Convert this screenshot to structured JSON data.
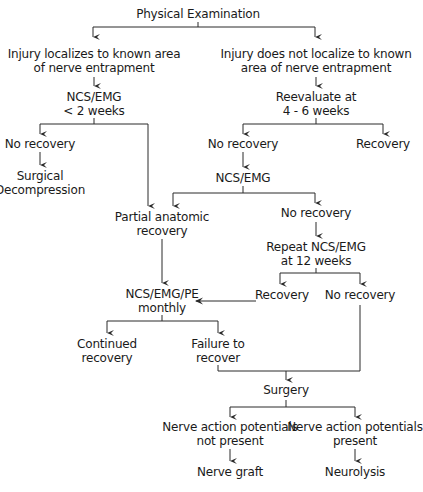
{
  "flowchart": {
    "nodes": [
      {
        "id": "physical-exam",
        "lines": [
          "Physical Examination"
        ],
        "x": 198,
        "y": 7
      },
      {
        "id": "injury-localizes",
        "lines": [
          "Injury localizes to known area",
          "of nerve entrapment"
        ],
        "x": 94,
        "y": 47
      },
      {
        "id": "injury-not-localize",
        "lines": [
          "Injury does not localize to known",
          "area of nerve entrapment"
        ],
        "x": 316,
        "y": 47
      },
      {
        "id": "ncs-emg-2wk",
        "lines": [
          "NCS/EMG",
          "< 2 weeks"
        ],
        "x": 94,
        "y": 90
      },
      {
        "id": "reevaluate",
        "lines": [
          "Reevaluate at",
          "4 - 6 weeks"
        ],
        "x": 316,
        "y": 90
      },
      {
        "id": "no-recovery-left",
        "lines": [
          "No recovery"
        ],
        "x": 40,
        "y": 137
      },
      {
        "id": "no-recovery-mid",
        "lines": [
          "No recovery"
        ],
        "x": 243,
        "y": 137
      },
      {
        "id": "recovery-right",
        "lines": [
          "Recovery"
        ],
        "x": 383,
        "y": 137
      },
      {
        "id": "surgical-decompression",
        "lines": [
          "Surgical",
          "Decompression"
        ],
        "x": 40,
        "y": 169
      },
      {
        "id": "ncs-emg-mid",
        "lines": [
          "NCS/EMG"
        ],
        "x": 243,
        "y": 171
      },
      {
        "id": "partial-anatomic",
        "lines": [
          "Partial anatomic",
          "recovery"
        ],
        "x": 162,
        "y": 210
      },
      {
        "id": "no-recovery-2",
        "lines": [
          "No recovery"
        ],
        "x": 316,
        "y": 206
      },
      {
        "id": "repeat-ncs",
        "lines": [
          "Repeat NCS/EMG",
          "at 12 weeks"
        ],
        "x": 316,
        "y": 240
      },
      {
        "id": "ncs-emg-pe",
        "lines": [
          "NCS/EMG/PE",
          "monthly"
        ],
        "x": 162,
        "y": 287
      },
      {
        "id": "recovery-12",
        "lines": [
          "Recovery"
        ],
        "x": 282,
        "y": 288
      },
      {
        "id": "no-recovery-12",
        "lines": [
          "No recovery"
        ],
        "x": 360,
        "y": 288
      },
      {
        "id": "continued-recovery",
        "lines": [
          "Continued",
          "recovery"
        ],
        "x": 107,
        "y": 337
      },
      {
        "id": "failure-to-recover",
        "lines": [
          "Failure to",
          "recover"
        ],
        "x": 218,
        "y": 337
      },
      {
        "id": "surgery",
        "lines": [
          "Surgery"
        ],
        "x": 286,
        "y": 383
      },
      {
        "id": "nap-not-present",
        "lines": [
          "Nerve action potentials",
          "not present"
        ],
        "x": 230,
        "y": 420
      },
      {
        "id": "nap-present",
        "lines": [
          "Nerve action potentials",
          "present"
        ],
        "x": 355,
        "y": 420
      },
      {
        "id": "nerve-graft",
        "lines": [
          "Nerve graft"
        ],
        "x": 230,
        "y": 465
      },
      {
        "id": "neurolysis",
        "lines": [
          "Neurolysis"
        ],
        "x": 355,
        "y": 465
      }
    ],
    "connectors": [
      {
        "from": "physical-exam",
        "to": [
          "injury-localizes",
          "injury-not-localize"
        ]
      },
      {
        "from": "injury-localizes",
        "to": [
          "ncs-emg-2wk"
        ]
      },
      {
        "from": "injury-not-localize",
        "to": [
          "reevaluate"
        ]
      },
      {
        "from": "ncs-emg-2wk",
        "to": [
          "no-recovery-left",
          "partial-anatomic"
        ]
      },
      {
        "from": "reevaluate",
        "to": [
          "no-recovery-mid",
          "recovery-right"
        ]
      },
      {
        "from": "no-recovery-left",
        "to": [
          "surgical-decompression"
        ]
      },
      {
        "from": "no-recovery-mid",
        "to": [
          "ncs-emg-mid"
        ]
      },
      {
        "from": "ncs-emg-mid",
        "to": [
          "partial-anatomic",
          "no-recovery-2"
        ]
      },
      {
        "from": "no-recovery-2",
        "to": [
          "repeat-ncs"
        ]
      },
      {
        "from": "partial-anatomic",
        "to": [
          "ncs-emg-pe"
        ]
      },
      {
        "from": "repeat-ncs",
        "to": [
          "recovery-12",
          "no-recovery-12"
        ]
      },
      {
        "from": "recovery-12",
        "to": [
          "ncs-emg-pe"
        ]
      },
      {
        "from": "ncs-emg-pe",
        "to": [
          "continued-recovery",
          "failure-to-recover"
        ]
      },
      {
        "from": "failure-to-recover",
        "to": [
          "surgery"
        ]
      },
      {
        "from": "no-recovery-12",
        "to": [
          "surgery"
        ]
      },
      {
        "from": "surgery",
        "to": [
          "nap-not-present",
          "nap-present"
        ]
      },
      {
        "from": "nap-not-present",
        "to": [
          "nerve-graft"
        ]
      },
      {
        "from": "nap-present",
        "to": [
          "neurolysis"
        ]
      }
    ]
  }
}
